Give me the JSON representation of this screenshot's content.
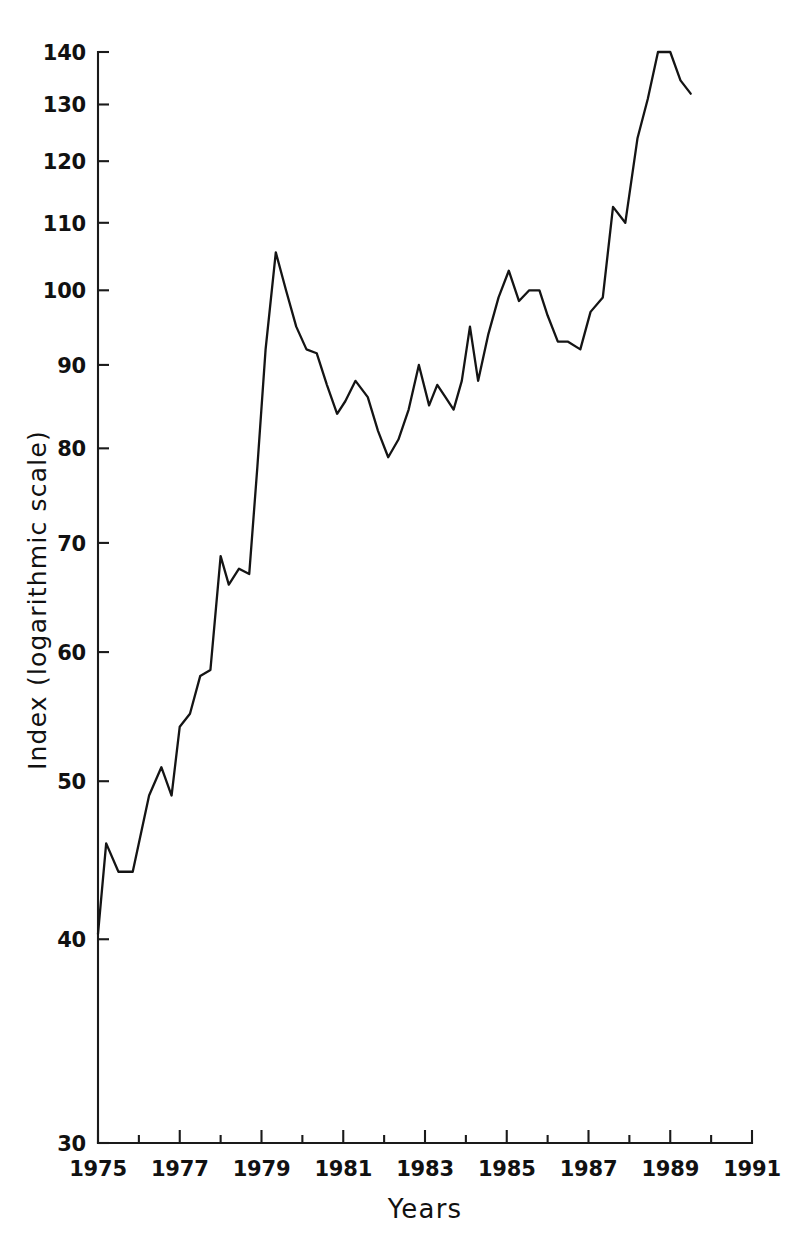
{
  "chart_data": {
    "type": "line",
    "title": "",
    "subtitle": "",
    "xlabel": "Years",
    "ylabel": "Index (logarithmic scale)",
    "yscale": "log",
    "xscale": "linear",
    "grid": false,
    "legend": false,
    "legend_position": "none",
    "line_color": "#141414",
    "background_color": "#ffffff",
    "xlim": [
      1975,
      1991
    ],
    "ylim": [
      30,
      140
    ],
    "x_tick_labels": [
      "1975",
      "1977",
      "1979",
      "1981",
      "1983",
      "1985",
      "1987",
      "1989",
      "1991"
    ],
    "x_tick_values": [
      1975,
      1977,
      1979,
      1981,
      1983,
      1985,
      1987,
      1989,
      1991
    ],
    "x_minor_tick_values": [
      1976,
      1978,
      1980,
      1982,
      1984,
      1986,
      1988,
      1990
    ],
    "y_tick_labels": [
      "30",
      "40",
      "50",
      "60",
      "70",
      "80",
      "90",
      "100",
      "110",
      "120",
      "130",
      "140"
    ],
    "y_tick_values": [
      30,
      40,
      50,
      60,
      70,
      80,
      90,
      100,
      110,
      120,
      130,
      140
    ],
    "series": [
      {
        "name": "Index",
        "x": [
          1975.0,
          1975.2,
          1975.5,
          1975.85,
          1976.25,
          1976.55,
          1976.8,
          1977.0,
          1977.25,
          1977.5,
          1977.75,
          1978.0,
          1978.2,
          1978.45,
          1978.7,
          1978.9,
          1979.1,
          1979.35,
          1979.6,
          1979.85,
          1980.1,
          1980.35,
          1980.6,
          1980.85,
          1981.05,
          1981.3,
          1981.6,
          1981.85,
          1982.1,
          1982.35,
          1982.6,
          1982.85,
          1983.1,
          1983.3,
          1983.5,
          1983.7,
          1983.9,
          1984.1,
          1984.3,
          1984.55,
          1984.8,
          1985.05,
          1985.3,
          1985.55,
          1985.8,
          1986.0,
          1986.25,
          1986.5,
          1986.8,
          1987.05,
          1987.35,
          1987.6,
          1987.9,
          1988.2,
          1988.45,
          1988.7,
          1989.0,
          1989.25,
          1989.5
        ],
        "y": [
          40.3,
          45.8,
          44.0,
          44.0,
          49.0,
          51.0,
          49.0,
          54.0,
          55.0,
          58.0,
          58.5,
          68.7,
          66.0,
          67.5,
          67.0,
          78.0,
          92.0,
          105.5,
          100.0,
          95.0,
          92.0,
          91.5,
          87.5,
          84.0,
          85.5,
          88.0,
          86.0,
          82.0,
          79.0,
          81.0,
          84.5,
          90.0,
          85.0,
          87.5,
          86.0,
          84.5,
          88.0,
          95.0,
          88.0,
          94.0,
          99.0,
          102.8,
          98.5,
          100.0,
          100.0,
          96.5,
          93.0,
          93.0,
          92.0,
          97.0,
          99.0,
          112.5,
          110.0,
          124.0,
          131.0,
          140.0,
          140.0,
          134.5,
          132.0
        ]
      }
    ],
    "annotations": []
  },
  "axes": {
    "x_axis_name": "years-axis",
    "y_axis_name": "index-axis"
  }
}
